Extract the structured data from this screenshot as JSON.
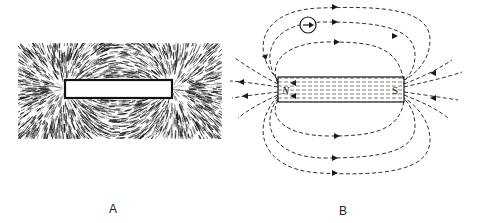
{
  "figure": {
    "panels": [
      {
        "id": "A",
        "label": "A",
        "description": "Iron filings pattern around a bar magnet",
        "magnet": {
          "x": 47,
          "y": 37,
          "w": 107,
          "h": 18
        }
      },
      {
        "id": "B",
        "label": "B",
        "description": "Magnetic field lines around a bar magnet with compass",
        "magnet": {
          "x": 48,
          "y": 77,
          "w": 126,
          "h": 25
        },
        "poles": {
          "north": "N",
          "south": "S"
        },
        "compass": {
          "cx": 78,
          "cy": 25,
          "r": 8
        }
      }
    ]
  },
  "colors": {
    "ink": "#1a1a1a",
    "background": "#ffffff",
    "magnet_fill": "#d8d8d8"
  }
}
